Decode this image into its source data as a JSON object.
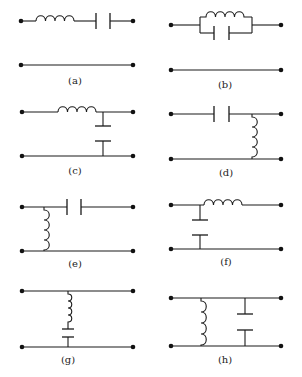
{
  "figure": {
    "panels": [
      {
        "id": "a",
        "label": "(a)",
        "description": "Series inductor and series capacitor in top line; bottom line plain"
      },
      {
        "id": "b",
        "label": "(b)",
        "description": "Parallel LC tank in series with top line; bottom line plain"
      },
      {
        "id": "c",
        "label": "(c)",
        "description": "Series inductor in top line, shunt capacitor to bottom line (output side)"
      },
      {
        "id": "d",
        "label": "(d)",
        "description": "Series capacitor in top line, shunt inductor to bottom line (output side)"
      },
      {
        "id": "e",
        "label": "(e)",
        "description": "Shunt inductor at input side, series capacitor in top line"
      },
      {
        "id": "f",
        "label": "(f)",
        "description": "Shunt capacitor at input side, series inductor in top line"
      },
      {
        "id": "g",
        "label": "(g)",
        "description": "Shunt series-LC branch between top and bottom lines"
      },
      {
        "id": "h",
        "label": "(h)",
        "description": "Shunt inductor and shunt capacitor in parallel between lines"
      }
    ],
    "colors": {
      "line": "#1a1a1a",
      "background": "#ffffff"
    }
  }
}
